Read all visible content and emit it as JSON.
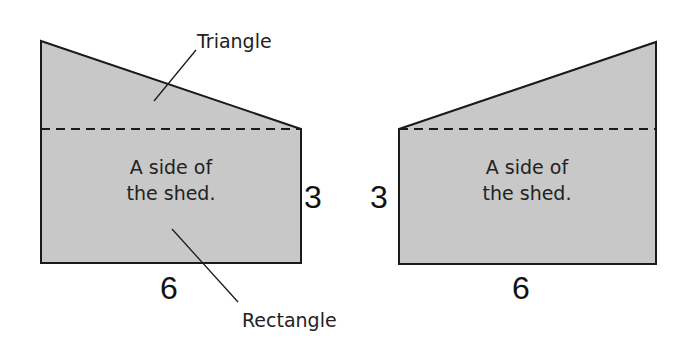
{
  "colors": {
    "fill": "#c8c8c8",
    "stroke": "#1a1a1a",
    "text": "#222222"
  },
  "left_figure": {
    "callout_top": "Triangle",
    "caption_line1": "A side of",
    "caption_line2": "the shed.",
    "height_label": "3",
    "width_label": "6",
    "callout_bottom": "Rectangle"
  },
  "right_figure": {
    "caption_line1": "A side of",
    "caption_line2": "the shed.",
    "height_label": "3",
    "width_label": "6"
  }
}
